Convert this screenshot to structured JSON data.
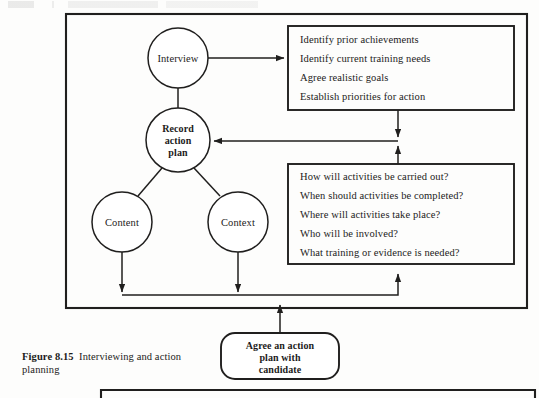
{
  "figure": {
    "caption_label": "Figure 8.15",
    "caption_text": "Interviewing and action planning"
  },
  "diagram": {
    "nodes": [
      {
        "id": "interview",
        "label": "Interview",
        "bold": false
      },
      {
        "id": "record-action-plan",
        "label": "Record\naction\nplan",
        "line1": "Record",
        "line2": "action",
        "line3": "plan",
        "bold": true
      },
      {
        "id": "content",
        "label": "Content",
        "bold": false
      },
      {
        "id": "context",
        "label": "Context",
        "bold": false
      }
    ],
    "top_box": {
      "name": "interview-outcomes-box",
      "items": [
        "Identify prior achievements",
        "Identify current training needs",
        "Agree realistic goals",
        "Establish priorities for action"
      ]
    },
    "bottom_box": {
      "name": "action-questions-box",
      "items": [
        "How will activities be carried out?",
        "When should activities be completed?",
        "Where will activities take place?",
        "Who will be involved?",
        "What training or evidence is needed?"
      ]
    },
    "outcome_box": {
      "name": "agree-action-plan-box",
      "line1": "Agree an action",
      "line2": "plan with",
      "line3": "candidate"
    }
  },
  "colors": {
    "ink": "#201f1e",
    "page": "#fdfdfc"
  }
}
